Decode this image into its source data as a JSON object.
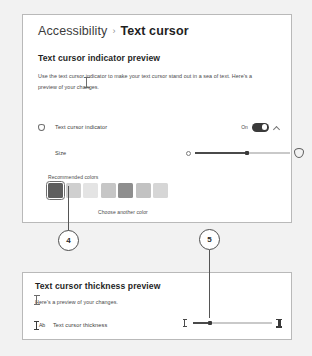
{
  "breadcrumb": {
    "parent": "Accessibility",
    "separator": "›",
    "current": "Text cursor"
  },
  "top_panel": {
    "section_title": "Text cursor indicator preview",
    "section_body": "Use the text cursor indicator to make your text cursor stand out in a sea of text. Here's a preview of your changes.",
    "indicator_row": {
      "label": "Text cursor indicator",
      "toggle_state": "On",
      "toggle_on": true
    },
    "size_row": {
      "label": "Size",
      "value_percent": 55
    },
    "colors": {
      "label": "Recommended colors",
      "choose_another": "Choose another color",
      "selected_index": 0,
      "swatches": [
        "#5e5e5e",
        "#cfcfcf",
        "#e4e4e4",
        "#c6c6c6",
        "#8e8e8e",
        "#c2c2c2",
        "#d6d6d6"
      ]
    }
  },
  "bottom_panel": {
    "section_title": "Text cursor thickness preview",
    "section_body": "Here's a preview of your changes.",
    "thickness_row": {
      "icon_text": "Ab",
      "label": "Text cursor thickness",
      "value_percent": 22
    }
  },
  "callouts": [
    {
      "number": "4"
    },
    {
      "number": "5"
    }
  ]
}
